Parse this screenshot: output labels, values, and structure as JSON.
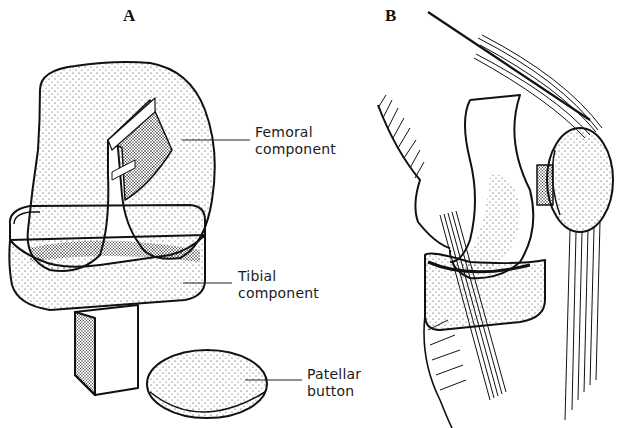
{
  "figure": {
    "panels": [
      {
        "id": "A",
        "label": "A"
      },
      {
        "id": "B",
        "label": "B"
      }
    ],
    "callouts": {
      "femoral": {
        "line1": "Femoral",
        "line2": "component"
      },
      "tibial": {
        "line1": "Tibial",
        "line2": "component"
      },
      "patellar": {
        "line1": "Patellar",
        "line2": "button"
      }
    },
    "colors": {
      "ink": "#111111",
      "paper": "#ffffff"
    }
  }
}
